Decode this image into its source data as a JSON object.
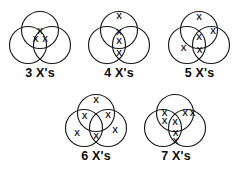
{
  "diagram": {
    "stroke_color": "#1a1a1a",
    "background_color": "#ffffff",
    "text_color": "#0d0d0d",
    "x_glyph": "X",
    "figures": [
      {
        "id": "fig-3",
        "label": "3 X's",
        "count": 3,
        "x_positions": [
          {
            "x": 33.0,
            "y": 26.5
          },
          {
            "x": 28.5,
            "y": 35.0
          },
          {
            "x": 38.0,
            "y": 35.0
          }
        ]
      },
      {
        "id": "fig-4",
        "label": "4 X's",
        "count": 4,
        "x_positions": [
          {
            "x": 33.0,
            "y": 12.0
          },
          {
            "x": 33.0,
            "y": 28.0
          },
          {
            "x": 33.0,
            "y": 36.5
          },
          {
            "x": 33.0,
            "y": 49.0
          }
        ]
      },
      {
        "id": "fig-5",
        "label": "5 X's",
        "count": 5,
        "x_positions": [
          {
            "x": 33.0,
            "y": 13.0
          },
          {
            "x": 47.0,
            "y": 26.5
          },
          {
            "x": 33.0,
            "y": 33.0
          },
          {
            "x": 17.5,
            "y": 44.0
          },
          {
            "x": 33.5,
            "y": 46.0
          }
        ]
      },
      {
        "id": "fig-6",
        "label": "6 X's",
        "count": 6,
        "x_positions": [
          {
            "x": 33.0,
            "y": 12.5
          },
          {
            "x": 21.5,
            "y": 28.5
          },
          {
            "x": 45.0,
            "y": 27.5
          },
          {
            "x": 14.0,
            "y": 45.5
          },
          {
            "x": 33.0,
            "y": 48.5
          },
          {
            "x": 52.0,
            "y": 43.0
          }
        ]
      },
      {
        "id": "fig-7",
        "label": "7 X's",
        "count": 7,
        "x_positions": [
          {
            "x": 22.5,
            "y": 26.0
          },
          {
            "x": 22.5,
            "y": 34.0
          },
          {
            "x": 43.0,
            "y": 25.5
          },
          {
            "x": 50.5,
            "y": 25.5
          },
          {
            "x": 33.0,
            "y": 35.0
          },
          {
            "x": 33.5,
            "y": 46.0
          },
          {
            "x": 33.5,
            "y": 53.5
          }
        ]
      }
    ],
    "circle_geometry": {
      "top": {
        "cx": 33.0,
        "cy": 26.0,
        "r": 18.5
      },
      "left": {
        "cx": 21.0,
        "cy": 41.0,
        "r": 18.5
      },
      "right": {
        "cx": 45.0,
        "cy": 41.0,
        "r": 18.5
      }
    }
  }
}
